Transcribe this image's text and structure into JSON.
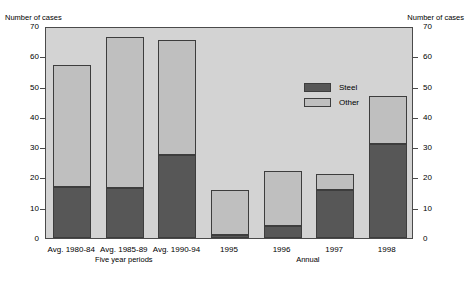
{
  "chart_data": {
    "type": "bar",
    "title": "",
    "subtitle": "",
    "stacked": true,
    "ylabel_left": "Number of cases",
    "ylabel_right": "Number of cases",
    "xlabel": "",
    "categories": [
      "Avg. 1980-84",
      "Avg. 1985-89",
      "Avg. 1990-94",
      "1995",
      "1996",
      "1997",
      "1998"
    ],
    "group_labels": [
      {
        "text": "Five year periods",
        "spans": [
          "Avg. 1980-84",
          "Avg. 1985-89",
          "Avg. 1990-94"
        ]
      },
      {
        "text": "Annual",
        "spans": [
          "1995",
          "1996",
          "1997",
          "1998"
        ]
      }
    ],
    "series": [
      {
        "name": "Steel",
        "color": "#575757",
        "values": [
          17,
          16.5,
          27.5,
          1,
          4,
          16,
          31
        ]
      },
      {
        "name": "Other",
        "color": "#bfbfbf",
        "values": [
          40,
          50,
          38,
          15,
          18,
          5,
          16
        ]
      }
    ],
    "totals": [
      57,
      66.5,
      65.5,
      16,
      22,
      21,
      47
    ],
    "ylim": [
      0,
      70
    ],
    "yticks": [
      0,
      10,
      20,
      30,
      40,
      50,
      60,
      70
    ],
    "ytick_labels": [
      "0",
      "10",
      "20",
      "30",
      "40",
      "50",
      "60",
      "70"
    ],
    "grid": false,
    "legend_position": "inside-top-center",
    "plot_background": "#d3d3d3",
    "frame_color": "#4a4a4a"
  },
  "legend": {
    "entries": [
      {
        "label": "Steel",
        "color": "#575757"
      },
      {
        "label": "Other",
        "color": "#bfbfbf"
      }
    ]
  }
}
